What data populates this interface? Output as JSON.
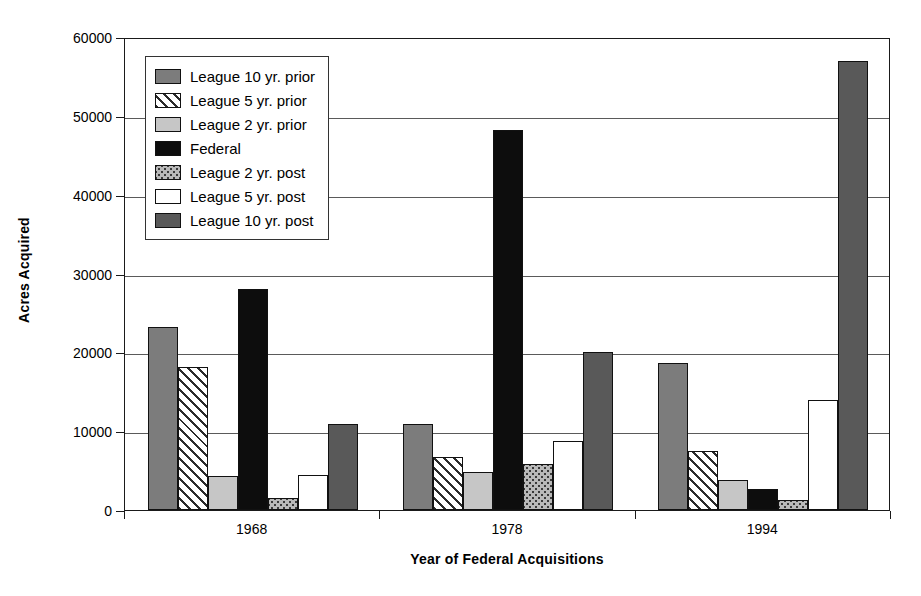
{
  "chart_data": {
    "type": "bar",
    "title": "",
    "xlabel": "Year of Federal Acquisitions",
    "ylabel": "Acres Acquired",
    "categories": [
      "1968",
      "1978",
      "1994"
    ],
    "ylim": [
      0,
      60000
    ],
    "ytick_labels": [
      "0",
      "10000",
      "20000",
      "30000",
      "40000",
      "50000",
      "60000"
    ],
    "ytick_values": [
      0,
      10000,
      20000,
      30000,
      40000,
      50000,
      60000
    ],
    "grid": "horizontal",
    "legend_position": "upper-left-inside",
    "series": [
      {
        "name": "League 10 yr. prior",
        "pattern": "dark-gray-solid",
        "values": [
          23200,
          10900,
          18700
        ]
      },
      {
        "name": "League 5 yr. prior",
        "pattern": "diagonal-hatch",
        "values": [
          18200,
          6700,
          7500
        ]
      },
      {
        "name": "League 2 yr. prior",
        "pattern": "light-gray-solid",
        "values": [
          4300,
          4800,
          3800
        ]
      },
      {
        "name": "Federal",
        "pattern": "black-solid",
        "values": [
          28000,
          48200,
          2700
        ]
      },
      {
        "name": "League 2 yr. post",
        "pattern": "stippled-dots",
        "values": [
          1500,
          5900,
          1300
        ]
      },
      {
        "name": "League 5 yr. post",
        "pattern": "white-solid",
        "values": [
          4400,
          8700,
          13900
        ]
      },
      {
        "name": "League 10 yr. post",
        "pattern": "dark-gray-solid-2",
        "values": [
          10900,
          20100,
          56900
        ]
      }
    ]
  },
  "legend": {
    "items": [
      {
        "label": "League 10 yr. prior"
      },
      {
        "label": "League 5 yr. prior"
      },
      {
        "label": "League 2 yr. prior"
      },
      {
        "label": "Federal"
      },
      {
        "label": "League 2 yr. post"
      },
      {
        "label": "League 5 yr. post"
      },
      {
        "label": "League 10 yr. post"
      }
    ]
  },
  "colors": {
    "dark_gray": "#7c7c7c",
    "light_gray": "#c6c6c6",
    "black": "#0d0d0d",
    "dark_gray_2": "#595959",
    "white": "#ffffff",
    "axis": "#1a1a1a",
    "gridline": "#5a5a5a"
  }
}
